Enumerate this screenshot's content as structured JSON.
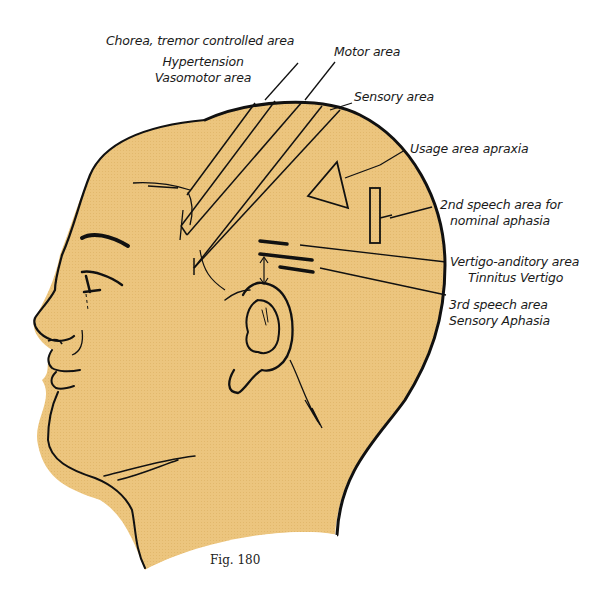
{
  "figure": {
    "caption": "Fig. 180",
    "skin_color": "#ecc57e",
    "outline_color": "#111111"
  },
  "labels": {
    "chorea": "Chorea, tremor controlled area",
    "hypertension_line1": "Hypertension",
    "hypertension_line2": "Vasomotor area",
    "motor": "Motor area",
    "sensory": "Sensory area",
    "usage": "Usage area apraxia",
    "speech2_line1": "2nd speech area for",
    "speech2_line2": "nominal aphasia",
    "vertigo_line1": "Vertigo-anditory area",
    "vertigo_line2": "Tinnitus Vertigo",
    "speech3_line1": "3rd speech area",
    "speech3_line2": "Sensory Aphasia"
  }
}
